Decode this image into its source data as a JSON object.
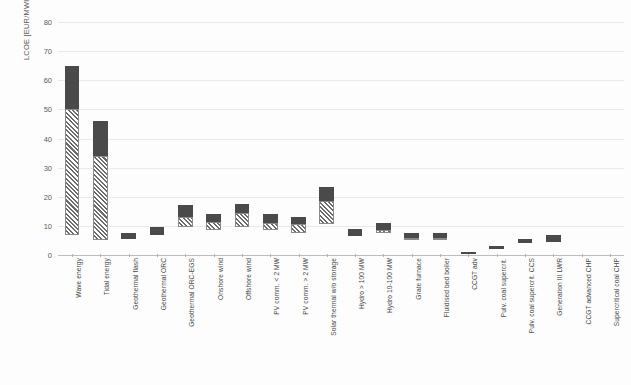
{
  "chart_data": {
    "type": "bar",
    "title": "",
    "subtitle": "",
    "xlabel": "",
    "ylabel": "LCOE [EUR/MWh]",
    "ylim": [
      0,
      80
    ],
    "yticks": [
      0,
      10,
      20,
      30,
      40,
      50,
      60,
      70,
      80
    ],
    "grid": true,
    "legend_position": "none",
    "orientation": "vertical",
    "bar_style": "floating range bars; lower segment hatched, upper segment solid dark",
    "categories": [
      "Wave energy",
      "Tidal energy",
      "Geothermal flash",
      "Geothermal ORC",
      "Geothermal ORC-EGS",
      "Onshore wind",
      "Offshore wind",
      "PV comm. < 2 MW",
      "PV comm. > 2 MW",
      "Solar thermal w/o storage",
      "Hydro > 100 MW",
      "Hydro 10-100 MW",
      "Grate furnace",
      "Fluidised bed boiler",
      "CCGT adv",
      "Pulv. coal supercrit.",
      "Pulv. coal supercrit. CCS",
      "Generation III LWR",
      "CCGT advanced CHP",
      "Supercritical coal CHP"
    ],
    "series": [
      {
        "name": "hatched segment (lower range)",
        "pattern": "hatch",
        "color": "#6b6b6b",
        "low": [
          7,
          5,
          null,
          null,
          9.5,
          8.5,
          9.5,
          8.5,
          7.5,
          10.5,
          null,
          7.5,
          5.0,
          5.0,
          null,
          null,
          null,
          null,
          null,
          null
        ],
        "high": [
          50,
          34,
          null,
          null,
          13.0,
          11.5,
          14.5,
          11.0,
          10.5,
          18.5,
          null,
          8.5,
          6.0,
          6.0,
          null,
          null,
          null,
          null,
          null,
          null
        ]
      },
      {
        "name": "solid segment (upper range)",
        "pattern": "solid",
        "color": "#4a4a4a",
        "low": [
          50,
          34,
          5.5,
          7.0,
          13.0,
          11.5,
          14.5,
          11.0,
          10.5,
          18.5,
          6.5,
          8.5,
          6.0,
          6.0,
          0.4,
          2.2,
          4.0,
          4.5,
          null,
          null
        ],
        "high": [
          65,
          46,
          7.5,
          9.5,
          17.0,
          14.0,
          17.5,
          14.0,
          13.0,
          23.5,
          9.0,
          11.0,
          7.5,
          7.5,
          0.9,
          3.0,
          5.5,
          7.0,
          null,
          null
        ]
      }
    ],
    "total_range_low": [
      7,
      5,
      5.5,
      7.0,
      9.5,
      8.5,
      9.5,
      8.5,
      7.5,
      10.5,
      6.5,
      7.5,
      5.0,
      5.0,
      0.4,
      2.2,
      4.0,
      4.5,
      null,
      null
    ],
    "total_range_high": [
      65,
      46,
      7.5,
      9.5,
      17.0,
      14.0,
      17.5,
      14.0,
      13.0,
      23.5,
      9.0,
      11.0,
      7.5,
      7.5,
      0.9,
      3.0,
      5.5,
      7.0,
      null,
      null
    ]
  }
}
